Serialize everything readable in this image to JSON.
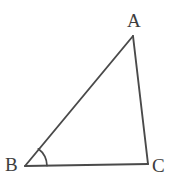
{
  "figure": {
    "kind": "geometry-diagram",
    "shape": "triangle",
    "canvas": {
      "width": 193,
      "height": 179,
      "background": "#ffffff"
    },
    "stroke": {
      "color": "#4a4a4a",
      "width": 1.9,
      "linecap": "round",
      "linejoin": "round"
    },
    "label_color": "#3d3d3d",
    "vertices": [
      {
        "name": "A",
        "label": "A",
        "x": 133,
        "y": 36,
        "label_x": 127,
        "label_y": 11
      },
      {
        "name": "B",
        "label": "B",
        "x": 25,
        "y": 166,
        "label_x": 5,
        "label_y": 155
      },
      {
        "name": "C",
        "label": "C",
        "x": 148,
        "y": 164,
        "label_x": 152,
        "label_y": 156
      }
    ],
    "edges": [
      {
        "name": "AB",
        "from": "A",
        "to": "B",
        "path": "M 133 36 L 25 166"
      },
      {
        "name": "BC",
        "from": "B",
        "to": "C",
        "path": "M 25 166 L 148 164"
      },
      {
        "name": "CA",
        "from": "C",
        "to": "A",
        "path": "M 148 164 L 133 36"
      }
    ],
    "angle_marks": [
      {
        "name": "angle-B",
        "at_vertex": "B",
        "radius": 22,
        "path": "M 47 165.6 A 22 22 0 0 0 38.3 148.8"
      }
    ]
  }
}
